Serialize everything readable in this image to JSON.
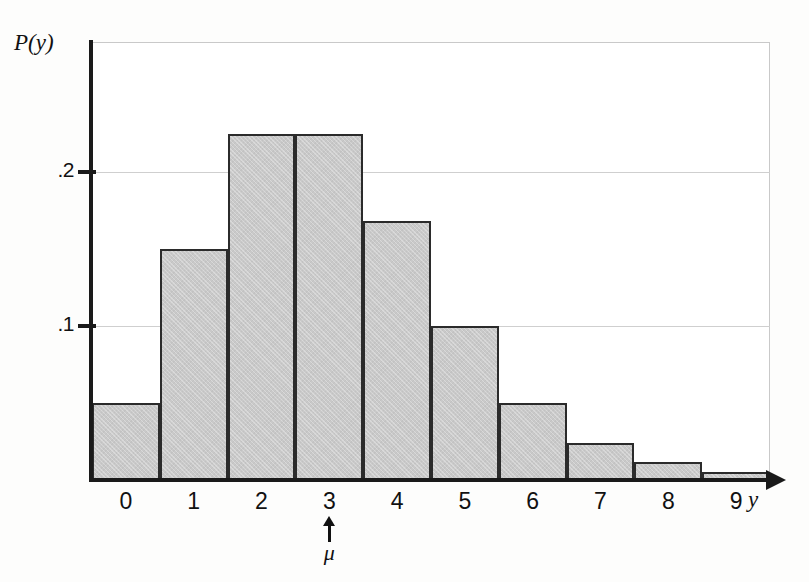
{
  "chart_data": {
    "type": "bar",
    "title": "",
    "subtitle": "",
    "xlabel": "y",
    "ylabel": "P(y)",
    "categories": [
      "0",
      "1",
      "2",
      "3",
      "4",
      "5",
      "6",
      "7",
      "8",
      "9"
    ],
    "values": [
      0.05,
      0.15,
      0.225,
      0.225,
      0.168,
      0.1,
      0.05,
      0.024,
      0.012,
      0.005
    ],
    "series": [
      {
        "name": "P(y)",
        "values": [
          0.05,
          0.15,
          0.225,
          0.225,
          0.168,
          0.1,
          0.05,
          0.024,
          0.012,
          0.005
        ]
      }
    ],
    "ylim": [
      0,
      0.2845
    ],
    "xlim": [
      -0.5,
      9.5
    ],
    "y_ticks": [
      0.1,
      0.2
    ],
    "y_tick_labels": [
      ".1",
      ".2"
    ],
    "x_tick_labels": [
      "0",
      "1",
      "2",
      "3",
      "4",
      "5",
      "6",
      "7",
      "8",
      "9"
    ],
    "grid": true,
    "grid_axis": "y",
    "legend": false,
    "legend_position": "none",
    "annotations": [
      {
        "text": "μ",
        "marker": "up-arrow",
        "at_category": "3",
        "x_value": 3,
        "placement": "below-axis"
      }
    ],
    "colors": {
      "bar_fill": "#c9c9c9",
      "bar_edge": "#2b2b2b",
      "axis": "#1a1a1a",
      "grid": "#cfcfcf",
      "frame": "#c9c9c9",
      "text": "#111111",
      "background": "#ffffff"
    }
  },
  "axis": {
    "y_title": "P(y)",
    "x_title": "y"
  },
  "y_ticks": [
    {
      "label": ".2",
      "value": 0.2
    },
    {
      "label": ".1",
      "value": 0.1
    }
  ],
  "x_ticks": [
    {
      "label": "0"
    },
    {
      "label": "1"
    },
    {
      "label": "2"
    },
    {
      "label": "3"
    },
    {
      "label": "4"
    },
    {
      "label": "5"
    },
    {
      "label": "6"
    },
    {
      "label": "7"
    },
    {
      "label": "8"
    },
    {
      "label": "9"
    }
  ],
  "mu_annotation": {
    "symbol": "μ",
    "at": "3"
  }
}
